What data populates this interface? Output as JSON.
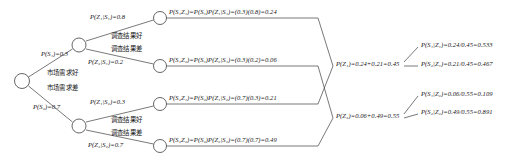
{
  "diagram": {
    "stroke_color": "#3a3a3a",
    "node_fill": "#ffffff",
    "text_color": "#161616",
    "nodes": [
      {
        "name": "root-node",
        "x": 22,
        "y": 81,
        "r": 7.5
      },
      {
        "name": "state-good-node",
        "x": 79,
        "y": 45,
        "r": 7
      },
      {
        "name": "state-bad-node",
        "x": 79,
        "y": 126,
        "r": 7
      },
      {
        "name": "outcome-s1z1-node",
        "x": 160,
        "y": 18,
        "r": 6.5
      },
      {
        "name": "outcome-s1z2-node",
        "x": 160,
        "y": 66,
        "r": 6.5
      },
      {
        "name": "outcome-s2z1-node",
        "x": 160,
        "y": 104,
        "r": 6.5
      },
      {
        "name": "outcome-s2z2-node",
        "x": 160,
        "y": 146,
        "r": 6.5
      }
    ],
    "branches": {
      "prior_good": {
        "prob_label": "P(S₁)=0.3",
        "cn_label": "市场需求好"
      },
      "prior_bad": {
        "prob_label": "P(S₂)=0.7",
        "cn_label": "市场需求差"
      },
      "s1_z1": {
        "prob_label": "P(Z₁|S₁)=0.8",
        "cn_label": "调查结果好"
      },
      "s1_z2": {
        "prob_label": "P(Z₂|S₁)=0.2",
        "cn_label": "调查结果差"
      },
      "s2_z1": {
        "prob_label": "P(Z₁|S₂)=0.3",
        "cn_label": "调查结果好"
      },
      "s2_z2": {
        "prob_label": "P(Z₂|S₂)=0.7",
        "cn_label": "调查结果差"
      }
    },
    "joint_probabilities": [
      {
        "name": "joint-s1z1",
        "text": "P(S₁Z₁)=P(S₁)P(Z₁|S₁)=(0.3)(0.8)=0.24"
      },
      {
        "name": "joint-s1z2",
        "text": "P(S₁Z₂)=P(S₁)P(Z₂|S₁)=(0.3)(0.2)=0.06"
      },
      {
        "name": "joint-s2z1",
        "text": "P(S₂Z₁)=P(S₂)P(Z₁|S₂)=(0.7)(0.3)=0.21"
      },
      {
        "name": "joint-s2z2",
        "text": "P(S₂Z₂)=P(S₂)P(Z₂|S₂)=(0.7)(0.7)=0.49"
      }
    ],
    "marginal_probabilities": [
      {
        "name": "marginal-z1",
        "text": "P(Z₁)=0.24+0.21=0.45"
      },
      {
        "name": "marginal-z2",
        "text": "P(Z₂)=0.06+0.49=0.55"
      }
    ],
    "posterior_probabilities": [
      {
        "name": "posterior-s1-given-z1",
        "text": "P(S₁|Z₁)=0.24/0.45=0.533"
      },
      {
        "name": "posterior-s2-given-z1",
        "text": "P(S₂|Z₁)=0.21/0.45=0.467"
      },
      {
        "name": "posterior-s1-given-z2",
        "text": "P(S₁|Z₂)=0.06/0.55=0.109"
      },
      {
        "name": "posterior-s2-given-z2",
        "text": "P(S₂|Z₂)=0.49/0.55=0.891"
      }
    ]
  }
}
